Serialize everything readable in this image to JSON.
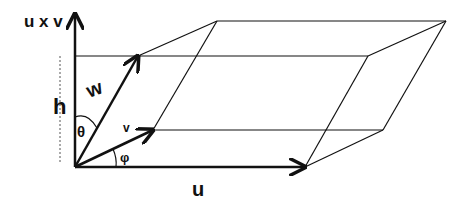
{
  "diagram": {
    "labels": {
      "axis": "u x v",
      "w": "w",
      "h": "h",
      "theta": "θ",
      "v": "v",
      "phi": "φ",
      "u": "u"
    },
    "vertices": {
      "origin": [
        75,
        167
      ],
      "u": [
        305,
        167
      ],
      "v": [
        153,
        130
      ],
      "w": [
        138,
        56
      ],
      "v_plus_w": [
        217,
        21
      ],
      "u_plus_v": [
        383,
        130
      ],
      "u_plus_w": [
        368,
        56
      ],
      "u_plus_v_plus_w": [
        446,
        21
      ]
    },
    "colors": {
      "stroke": "#111111",
      "background": "#ffffff"
    }
  }
}
